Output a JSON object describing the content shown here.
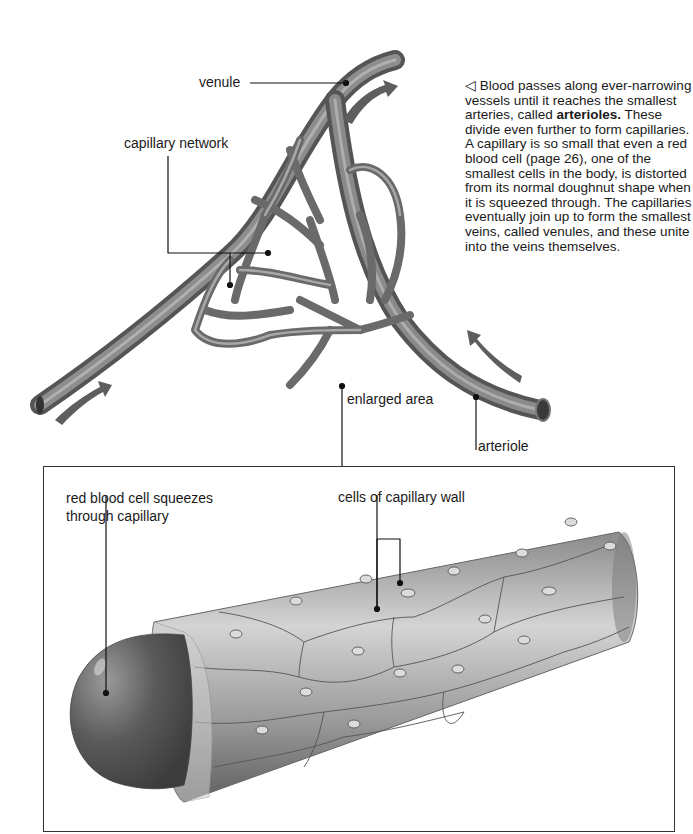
{
  "figure": {
    "caption": {
      "arrow_glyph": "◁",
      "intro": "Blood passes along ever-narrowing vessels until it reaches the smallest arteries, called ",
      "bold_term": "arterioles.",
      "rest": " These divide even further to form capillaries. A capillary is so small that even a red blood cell (page 26), one of the smallest cells in the body, is distorted from its normal doughnut shape when it is squeezed through. The capillaries eventually join up to form the smallest veins, called venules, and these unite into the veins themselves."
    },
    "labels": {
      "venule": "venule",
      "capillary_network": "capillary network",
      "enlarged_area": "enlarged area",
      "arteriole": "arteriole",
      "red_blood_cell_line1": "red blood cell squeezes",
      "red_blood_cell_line2": "through capillary",
      "cells_of_capillary_wall": "cells of capillary wall"
    },
    "colors": {
      "vessel": "#6e6e6e",
      "vessel_highlight": "#b5b5b5",
      "flow_arrow": "#5e5e5e",
      "leader_line": "#111111",
      "capillary_wall": "#b8b8b8",
      "red_blood_cell": "#5a5a5a"
    }
  }
}
